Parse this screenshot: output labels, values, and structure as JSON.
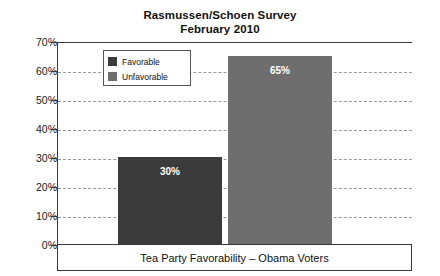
{
  "chart_data": {
    "type": "bar",
    "title": "Rasmussen/Schoen Survey",
    "subtitle": "February 2010",
    "xlabel": "Tea Party Favorability – Obama Voters",
    "ylabel": "",
    "categories": [
      "Favorable",
      "Unfavorable"
    ],
    "values": [
      30,
      65
    ],
    "value_labels": [
      "30%",
      "65%"
    ],
    "ylim": [
      0,
      70
    ],
    "ytick_values": [
      0,
      10,
      20,
      30,
      40,
      50,
      60,
      70
    ],
    "ytick_labels": [
      "0%",
      "10%",
      "20%",
      "30%",
      "40%",
      "50%",
      "60%",
      "70%"
    ],
    "grid": true,
    "grid_style": "dashed",
    "legend_position": "top-left-inside",
    "series": [
      {
        "name": "Favorable",
        "value": 30,
        "label": "30%",
        "color": "#3b3b3b"
      },
      {
        "name": "Unfavorable",
        "value": 65,
        "label": "65%",
        "color": "#6e6e6e"
      }
    ],
    "colors": {
      "favorable": "#3b3b3b",
      "unfavorable": "#6e6e6e",
      "axis": "#3a3a3a",
      "gridline": "#9a9a9a",
      "text": "#111111",
      "bar_label_text": "#ffffff",
      "background": "#ffffff"
    }
  }
}
